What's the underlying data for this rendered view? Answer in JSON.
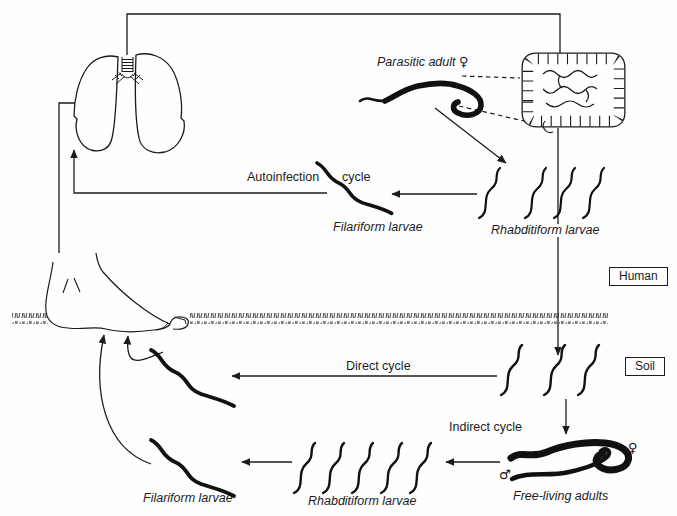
{
  "figure": {
    "colors": {
      "ink": "#1b1b1b",
      "background": "#fefefe"
    },
    "compartments": {
      "human": "Human",
      "soil": "Soil"
    },
    "labels": {
      "parasitic_adult": "Parasitic adult",
      "female_symbol": "♀",
      "male_symbol": "♂",
      "autoinfection": "Autoinfection",
      "autoinfection_cycle_word": "cycle",
      "filariform_upper": "Filariform larvae",
      "rhabditiform_upper": "Rhabditiform larvae",
      "direct_cycle": "Direct cycle",
      "indirect_cycle": "Indirect cycle",
      "free_living_adults": "Free-living adults",
      "rhabditiform_lower": "Rhabditiform larvae",
      "filariform_lower": "Filariform larvae"
    }
  }
}
